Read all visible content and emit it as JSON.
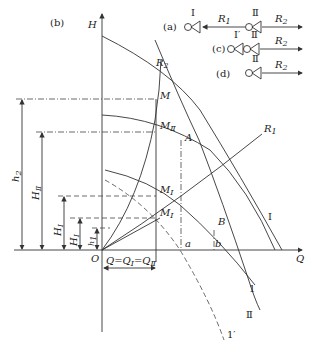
{
  "figure": {
    "panel_b_label": "(b)",
    "axes": {
      "y_label": "H",
      "x_label": "Q",
      "origin_label": "O"
    },
    "points": {
      "M": "M",
      "MII": "M",
      "MII_sub": "Ⅱ",
      "A": "A",
      "MI": "M",
      "MI_sub": "Ⅰ",
      "MI_prime": "M",
      "MI_prime_sub": "Ⅰ",
      "MI_prime_sup": "′",
      "B": "B",
      "a": "a",
      "b": "b"
    },
    "curves": {
      "R1": "R",
      "R1_sub": "1",
      "R2": "R",
      "R2_sub": "2",
      "I": "Ⅰ",
      "II": "Ⅱ",
      "one": "1",
      "one_prime": "1′"
    },
    "heights": {
      "h2": "h",
      "h2_sub": "2",
      "HII": "H",
      "HII_sub": "Ⅱ",
      "HI": "H",
      "HI_sub": "Ⅰ",
      "HI_prime": "H",
      "HI_prime_sub": "Ⅰ",
      "HI_prime_sup": "′",
      "h1": "h",
      "h1_sub": "1"
    },
    "flow_label": "Q=Q",
    "flow_sub1": "Ⅰ",
    "flow_eq": "=Q",
    "flow_sub2": "Ⅱ"
  },
  "schematics": {
    "a": {
      "label": "(a)",
      "pump1": "Ⅰ",
      "pump2": "Ⅱ",
      "r1": "R",
      "r1_sub": "1",
      "r2": "R",
      "r2_sub": "2"
    },
    "c": {
      "label": "(c)",
      "pump1": "Ⅰ′",
      "pump2": "Ⅱ",
      "r2": "R",
      "r2_sub": "2"
    },
    "d": {
      "label": "(d)",
      "pump2": "Ⅱ",
      "r2": "R",
      "r2_sub": "2"
    }
  }
}
